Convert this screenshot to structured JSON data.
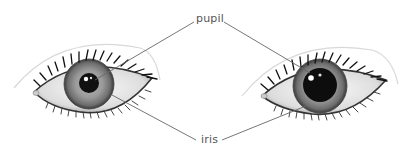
{
  "diagram": {
    "type": "eye anatomy comparison",
    "labels": {
      "top": "pupil",
      "bottom": "iris"
    },
    "eyes": [
      {
        "name": "left-eye",
        "pupil_size": "small (constricted)"
      },
      {
        "name": "right-eye",
        "pupil_size": "large (dilated)"
      }
    ],
    "colors": {
      "leader_line": "#666666",
      "label_text": "#555555",
      "pupil": "#111111",
      "iris": "#8a8a8a"
    }
  }
}
